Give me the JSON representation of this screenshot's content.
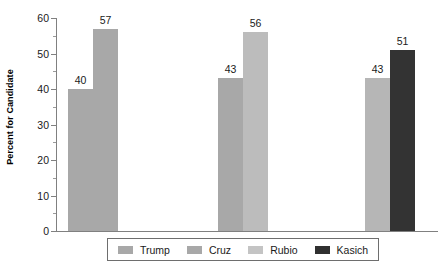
{
  "chart_data": {
    "type": "bar",
    "title": "",
    "xlabel": "",
    "ylabel": "Percent for Candidate",
    "ylim": [
      0,
      60
    ],
    "ytick_labels": [
      "0",
      "10",
      "20",
      "30",
      "40",
      "50",
      "60"
    ],
    "ytick_values": [
      0,
      10,
      20,
      30,
      40,
      50,
      60
    ],
    "yminor_values": [
      5,
      15,
      25,
      35,
      45,
      55
    ],
    "grid": false,
    "legend_position": "bottom",
    "categories": [
      "Trump vs Cruz",
      "Trump vs Rubio",
      "Trump vs Kasich"
    ],
    "series": [
      {
        "name": "Trump",
        "color": "#a8a8a8",
        "values": [
          40,
          43,
          43
        ]
      },
      {
        "name": "Cruz",
        "color": "#a8a8a8",
        "values": [
          57,
          null,
          null
        ]
      },
      {
        "name": "Rubio",
        "color": "#bcbcbc",
        "values": [
          null,
          56,
          null
        ]
      },
      {
        "name": "Kasich",
        "color": "#333333",
        "values": [
          null,
          null,
          51
        ]
      }
    ],
    "bars": [
      {
        "label": "40",
        "value": 40,
        "series": "Trump",
        "color": "#a8a8a8",
        "x": 68,
        "width": 25
      },
      {
        "label": "57",
        "value": 57,
        "series": "Cruz",
        "color": "#a8a8a8",
        "x": 93,
        "width": 25
      },
      {
        "label": "43",
        "value": 43,
        "series": "Trump",
        "color": "#a8a8a8",
        "x": 218,
        "width": 25
      },
      {
        "label": "56",
        "value": 56,
        "series": "Rubio",
        "color": "#bcbcbc",
        "x": 243,
        "width": 25
      },
      {
        "label": "43",
        "value": 43,
        "series": "Trump",
        "color": "#b6b6b6",
        "x": 365,
        "width": 25
      },
      {
        "label": "51",
        "value": 51,
        "series": "Kasich",
        "color": "#333333",
        "x": 390,
        "width": 25
      }
    ],
    "legend": [
      {
        "label": "Trump",
        "color": "#a8a8a8"
      },
      {
        "label": "Cruz",
        "color": "#a8a8a8"
      },
      {
        "label": "Rubio",
        "color": "#c4c4c4"
      },
      {
        "label": "Kasich",
        "color": "#303030"
      }
    ]
  }
}
